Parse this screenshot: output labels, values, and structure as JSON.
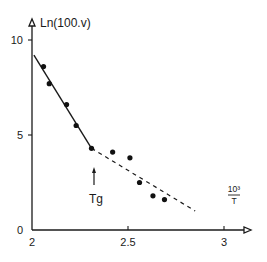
{
  "chart_data": {
    "type": "scatter",
    "title": "",
    "xlabel": "10³/T",
    "xlabel_num": "10³",
    "xlabel_den": "T",
    "ylabel": "Ln(100.v)",
    "xlim": [
      2,
      3.1
    ],
    "ylim": [
      0,
      10.5
    ],
    "x_ticks": [
      2,
      2.5,
      3
    ],
    "x_tick_labels": [
      "2",
      "2.5",
      "3"
    ],
    "y_ticks": [
      0,
      5,
      10
    ],
    "y_tick_labels": [
      "0",
      "5",
      "10"
    ],
    "grid": false,
    "legend": null,
    "series": [
      {
        "name": "measured",
        "marker": "filled-circle",
        "points": [
          {
            "x": 2.06,
            "y": 8.6
          },
          {
            "x": 2.09,
            "y": 7.7
          },
          {
            "x": 2.18,
            "y": 6.6
          },
          {
            "x": 2.23,
            "y": 5.5
          },
          {
            "x": 2.31,
            "y": 4.3
          },
          {
            "x": 2.42,
            "y": 4.1
          },
          {
            "x": 2.51,
            "y": 3.8
          },
          {
            "x": 2.56,
            "y": 2.5
          },
          {
            "x": 2.63,
            "y": 1.8
          },
          {
            "x": 2.69,
            "y": 1.6
          }
        ]
      }
    ],
    "lines": [
      {
        "name": "fit-above-Tg",
        "style": "solid",
        "from": {
          "x": 2.01,
          "y": 9.2
        },
        "to": {
          "x": 2.31,
          "y": 4.3
        }
      },
      {
        "name": "fit-below-Tg",
        "style": "dashed",
        "from": {
          "x": 2.31,
          "y": 4.3
        },
        "to": {
          "x": 2.85,
          "y": 1.0
        }
      }
    ],
    "annotations": [
      {
        "text": "Tg",
        "x": 2.31,
        "y": 1.9,
        "arrow_to": {
          "x": 2.31,
          "y": 3.0
        }
      }
    ]
  }
}
